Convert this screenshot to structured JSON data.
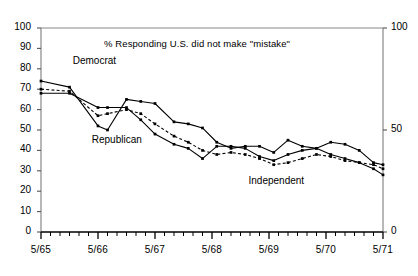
{
  "chart_data": {
    "type": "line",
    "title": "% Responding U.S. did not make \"mistake\"",
    "xlabel": "",
    "ylabel": "",
    "ylim": [
      0,
      100
    ],
    "ytick_values": [
      0,
      10,
      20,
      30,
      40,
      50,
      60,
      70,
      80,
      90,
      100
    ],
    "ytick_labels": [
      "0",
      "10",
      "20",
      "30",
      "40",
      "50",
      "60",
      "70",
      "80",
      "90",
      "100"
    ],
    "right_axis_tick_values": [
      0,
      50,
      100
    ],
    "right_axis_tick_labels": [
      "0",
      "50",
      "100"
    ],
    "xtick_labels": [
      "5/65",
      "5/66",
      "5/67",
      "5/68",
      "5/69",
      "5/70",
      "5/71"
    ],
    "xlim": [
      0,
      72
    ],
    "x_unit": "months since 5/65",
    "minor_ticks": "bimonthly",
    "grid": false,
    "legend_position": "inline-annotations",
    "series": [
      {
        "name": "Republican",
        "style": "solid",
        "marker": "square",
        "x": [
          0,
          6,
          12,
          14,
          18,
          21,
          24,
          28,
          31,
          34,
          37,
          40,
          43,
          46,
          49,
          52,
          55,
          58,
          61,
          64,
          67,
          70,
          72
        ],
        "values": [
          74,
          71,
          52,
          50,
          65,
          64,
          63,
          54,
          53,
          51,
          44,
          41,
          42,
          42,
          39,
          45,
          42,
          41,
          44,
          43,
          40,
          34,
          33
        ]
      },
      {
        "name": "Democrat",
        "style": "solid",
        "marker": "square",
        "x": [
          0,
          6,
          12,
          14,
          18,
          21,
          24,
          28,
          31,
          34,
          37,
          40,
          43,
          46,
          49,
          52,
          55,
          58,
          61,
          64,
          67,
          70,
          72
        ],
        "values": [
          68,
          68,
          61,
          61,
          61,
          55,
          48,
          43,
          41,
          36,
          42,
          42,
          41,
          37,
          35,
          38,
          40,
          41,
          38,
          36,
          34,
          31,
          28
        ]
      },
      {
        "name": "Independent",
        "style": "dashed",
        "marker": "square",
        "x": [
          0,
          6,
          12,
          14,
          18,
          21,
          24,
          28,
          31,
          34,
          37,
          40,
          43,
          46,
          49,
          52,
          55,
          58,
          61,
          64,
          67,
          70,
          72
        ],
        "values": [
          70,
          69,
          57,
          58,
          60,
          58,
          53,
          47,
          44,
          40,
          38,
          39,
          38,
          36,
          33,
          34,
          36,
          38,
          37,
          35,
          34,
          33,
          31
        ]
      }
    ],
    "annotations": [
      {
        "text": "Democrat",
        "x": 5,
        "y": 84
      },
      {
        "text": "Republican",
        "x": 9,
        "y": 45
      },
      {
        "text": "Independent",
        "x": 42,
        "y": 25
      }
    ]
  }
}
